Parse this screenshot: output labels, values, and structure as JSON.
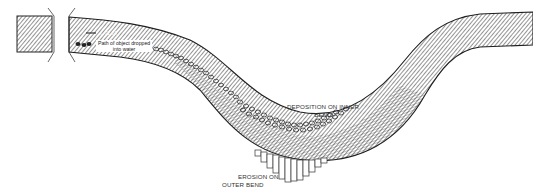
{
  "diagram": {
    "labels": {
      "scale_label": "→ 72 JA",
      "path_label_line1": "Path of object dropped",
      "path_label_line2": "into water",
      "deposition_line1": "DEPOSITION   ON INNER",
      "deposition_line2": "BEND",
      "erosion_line1": "EROSION  ON",
      "erosion_line2": "OUTER BEND"
    },
    "icons": {
      "break_marks": "break-line-icon",
      "object_path": "pebble-chain-icon",
      "deposition": "pebble-cluster-icon",
      "erosion": "erosion-bars-icon"
    },
    "colors": {
      "water_fill": "#ffffff",
      "hatch": "#444444",
      "outline": "#222222",
      "background": "#ffffff"
    }
  }
}
